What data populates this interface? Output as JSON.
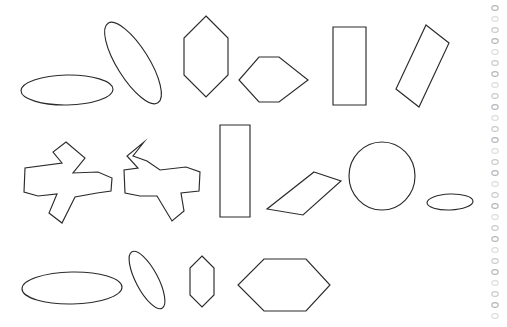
{
  "page": {
    "background_color": "#ffffff",
    "width": 507,
    "height": 327,
    "stroke_color": "#2b2b2b",
    "stroke_width": 1.15
  },
  "binding": {
    "name": "spiral-binding-edge",
    "hole_color": "#c9c9ce",
    "hole_count": 29,
    "first_hole_y": 8,
    "hole_spacing": 11,
    "hole_center_x": 12,
    "hole_radius_x": 3.2,
    "hole_radius_y": 2.4
  },
  "rows": [
    {
      "name": "row-top",
      "label": "Top row",
      "shape_ids": [
        "ellipse-flat-top-left",
        "ellipse-tilted-top",
        "hexagon-vertical-top",
        "hexagon-horizontal-top",
        "rectangle-vertical-top",
        "rectangle-tilted-top-right"
      ]
    },
    {
      "name": "row-middle",
      "label": "Middle row",
      "shape_ids": [
        "cross-irregular-left",
        "cross-irregular-right",
        "rectangle-vertical-middle",
        "parallelogram-tilted-middle",
        "circle-middle",
        "ellipse-small-middle-right"
      ]
    },
    {
      "name": "row-bottom",
      "label": "Bottom row",
      "shape_ids": [
        "ellipse-wide-bottom-left",
        "ellipse-tilted-bottom",
        "hexagon-small-vertical-bottom",
        "hexagon-large-horizontal-bottom"
      ]
    }
  ],
  "shapes": [
    {
      "id": "ellipse-flat-top-left",
      "name": "ellipse-flat-top-left",
      "type": "ellipse",
      "label": "Flat ellipse",
      "cx": 67,
      "cy": 90,
      "rx": 46,
      "ry": 15,
      "rotation": -1
    },
    {
      "id": "ellipse-tilted-top",
      "name": "ellipse-tilted-top",
      "type": "ellipse",
      "label": "Tilted narrow ellipse",
      "cx": 133,
      "cy": 63,
      "rx": 47,
      "ry": 16,
      "rotation": 58
    },
    {
      "id": "hexagon-vertical-top",
      "name": "hexagon-vertical-top",
      "type": "polygon",
      "label": "Vertical hexagon",
      "points": "206,16 228,38 228,75 206,97 184,75 184,38"
    },
    {
      "id": "hexagon-horizontal-top",
      "name": "hexagon-horizontal-top",
      "type": "polygon",
      "label": "Horizontal hexagon",
      "points": "259,57 279,57 308,80 279,102 259,102 239,80"
    },
    {
      "id": "rectangle-vertical-top",
      "name": "rectangle-vertical-top",
      "type": "polygon",
      "label": "Vertical rectangle",
      "points": "333,27 366,27 366,105 333,105"
    },
    {
      "id": "rectangle-tilted-top-right",
      "name": "rectangle-tilted-top-right",
      "type": "polygon",
      "label": "Tilted rectangle",
      "points": "426,25 449,43 419,107 396,89"
    },
    {
      "id": "cross-irregular-left",
      "name": "cross-irregular-left",
      "type": "polygon",
      "label": "Irregular cross",
      "points": "66,142 85,158 73,173 98,172 112,178 111,191 97,193 75,197 62,223 49,213 57,194 38,196 24,192 25,168 62,163 53,152"
    },
    {
      "id": "cross-irregular-right",
      "name": "cross-irregular-right",
      "type": "polygon",
      "label": "Irregular cross mirrored",
      "points": "144,142 133,156 147,161 160,170 186,167 200,172 199,191 181,193 184,211 172,221 157,196 140,196 125,193 124,170 138,168 127,156"
    },
    {
      "id": "rectangle-vertical-middle",
      "name": "rectangle-vertical-middle",
      "type": "polygon",
      "label": "Vertical rectangle",
      "points": "220,125 250,125 250,217 220,217"
    },
    {
      "id": "parallelogram-tilted-middle",
      "name": "parallelogram-tilted-middle",
      "type": "polygon",
      "label": "Tilted parallelogram",
      "points": "314,172 341,181 303,215 267,209"
    },
    {
      "id": "circle-middle",
      "name": "circle-middle",
      "type": "ellipse",
      "label": "Circle",
      "cx": 382,
      "cy": 176,
      "rx": 33,
      "ry": 34,
      "rotation": 0
    },
    {
      "id": "ellipse-small-middle-right",
      "name": "ellipse-small-middle-right",
      "type": "ellipse",
      "label": "Small flat ellipse",
      "cx": 450,
      "cy": 202,
      "rx": 23,
      "ry": 8,
      "rotation": -2
    },
    {
      "id": "ellipse-wide-bottom-left",
      "name": "ellipse-wide-bottom-left",
      "type": "ellipse",
      "label": "Wide flat ellipse",
      "cx": 72,
      "cy": 288,
      "rx": 50,
      "ry": 16,
      "rotation": -1
    },
    {
      "id": "ellipse-tilted-bottom",
      "name": "ellipse-tilted-bottom",
      "type": "ellipse",
      "label": "Tilted narrow ellipse",
      "cx": 147,
      "cy": 280,
      "rx": 32,
      "ry": 11,
      "rotation": 62
    },
    {
      "id": "hexagon-small-vertical-bottom",
      "name": "hexagon-small-vertical-bottom",
      "type": "polygon",
      "label": "Small vertical hexagon",
      "points": "202,256 214,268 214,295 202,307 190,295 190,268"
    },
    {
      "id": "hexagon-large-horizontal-bottom",
      "name": "hexagon-large-horizontal-bottom",
      "type": "polygon",
      "label": "Large horizontal hexagon",
      "points": "264,259 306,259 330,285 306,311 264,311 238,285"
    }
  ]
}
